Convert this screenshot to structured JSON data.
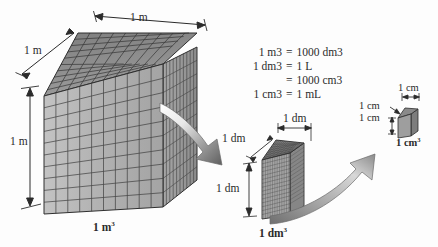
{
  "figure": {
    "background_color": "#fdfdfd",
    "ink_color": "#2b2b2b"
  },
  "equations": {
    "lines": [
      {
        "lhs": "1 m3",
        "lhs_base": "1 m",
        "lhs_sup": "3",
        "eq": "=",
        "rhs_base": "1000 dm",
        "rhs_sup": "3"
      },
      {
        "lhs_base": "1 dm",
        "lhs_sup": "3",
        "eq": "=",
        "rhs_base": "1 L",
        "rhs_sup": ""
      },
      {
        "lhs_base": "",
        "lhs_sup": "",
        "eq": "=",
        "rhs_base": "1000 cm",
        "rhs_sup": "3"
      },
      {
        "lhs_base": "1 cm",
        "lhs_sup": "3",
        "eq": "=",
        "rhs_base": "1 mL",
        "rhs_sup": ""
      }
    ]
  },
  "cube_large": {
    "name": "cubic-meter",
    "volume_label_base": "1 m",
    "volume_label_sup": "3",
    "divisions_per_edge": 10,
    "dimensions": [
      {
        "id": "depth",
        "label": "1 m"
      },
      {
        "id": "width",
        "label": "1 m"
      },
      {
        "id": "height",
        "label": "1 m"
      }
    ],
    "colors": {
      "top": "#8d8d8d",
      "front": "#b4b4b4",
      "right": "#9a9a9a",
      "grid": "#3a3a3a"
    }
  },
  "cube_medium": {
    "name": "cubic-decimeter",
    "volume_label_base": "1 dm",
    "volume_label_sup": "3",
    "divisions_per_edge": 16,
    "dimensions": [
      {
        "id": "depth",
        "label": "1 dm"
      },
      {
        "id": "width",
        "label": "1 dm"
      },
      {
        "id": "height",
        "label": "1 dm"
      }
    ],
    "colors": {
      "top": "#8d8d8d",
      "front": "#b0b0b0",
      "right": "#9a9a9a",
      "grid": "#3a3a3a"
    }
  },
  "cube_small": {
    "name": "cubic-centimeter",
    "volume_label_base": "1 cm",
    "volume_label_sup": "3",
    "divisions_per_edge": 1,
    "dimensions": [
      {
        "id": "depth",
        "label": "1 cm"
      },
      {
        "id": "height",
        "label": "1 cm"
      },
      {
        "id": "width",
        "label": "1 cm"
      }
    ],
    "colors": {
      "top": "#8d8d8d",
      "front": "#9e9e9e",
      "right": "#7e7e7e",
      "grid": "#3a3a3a"
    }
  },
  "arrows": {
    "arrow_large_to_medium": "curved-zoom-arrow",
    "arrow_medium_to_small": "curved-zoom-arrow"
  }
}
